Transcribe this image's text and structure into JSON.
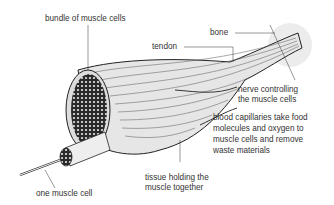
{
  "diagram": {
    "labels": {
      "bundle": "bundle of muscle cells",
      "tendon": "tendon",
      "bone": "bone",
      "nerve_line1": "nerve controlling",
      "nerve_line2": "the muscle cells",
      "blood_line1": "blood capillaries take food",
      "blood_line2": "molecules and oxygen to",
      "blood_line3": "muscle cells and remove",
      "blood_line4": "waste materials",
      "tissue_line1": "tissue holding the",
      "tissue_line2": "muscle together",
      "cell": "one muscle cell"
    },
    "colors": {
      "outline": "#222222",
      "muscle_fill": "#e6e6e6",
      "bone_shade": "#ececec",
      "text": "#333333"
    }
  }
}
